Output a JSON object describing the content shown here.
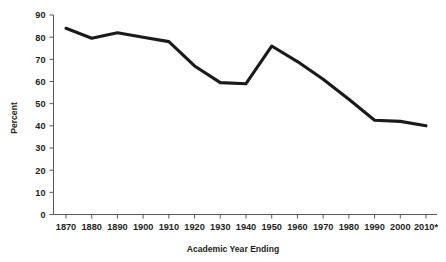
{
  "chart_data": {
    "type": "line",
    "title": "",
    "xlabel": "Academic Year Ending",
    "ylabel": "Percent",
    "categories": [
      "1870",
      "1880",
      "1890",
      "1900",
      "1910",
      "1920",
      "1930",
      "1940",
      "1950",
      "1960",
      "1970",
      "1980",
      "1990",
      "2000",
      "2010*"
    ],
    "values": [
      84,
      79.5,
      82,
      80,
      78,
      67,
      59.5,
      59,
      76,
      69,
      61,
      52,
      42.5,
      42,
      40
    ],
    "series": [
      {
        "name": "Percent",
        "values": [
          84,
          79.5,
          82,
          80,
          78,
          67,
          59.5,
          59,
          76,
          69,
          61,
          52,
          42.5,
          42,
          40
        ]
      }
    ],
    "ylim": [
      0,
      90
    ],
    "yticks": [
      0,
      10,
      20,
      30,
      40,
      50,
      60,
      70,
      80,
      90
    ],
    "ytick_labels": [
      "0",
      "10",
      "20",
      "30",
      "40",
      "50",
      "60",
      "70",
      "80",
      "90"
    ],
    "xtick_labels": [
      "1870",
      "1880",
      "1890",
      "1900",
      "1910",
      "1920",
      "1930",
      "1940",
      "1950",
      "1960",
      "1970",
      "1980",
      "1990",
      "2000",
      "2010*"
    ],
    "grid": false,
    "legend": "none",
    "line_color": "#1a1a1a",
    "axis_color": "#58595b",
    "background_color": "#ffffff"
  },
  "axis": {
    "y_title": "Percent",
    "x_title": "Academic Year Ending"
  }
}
